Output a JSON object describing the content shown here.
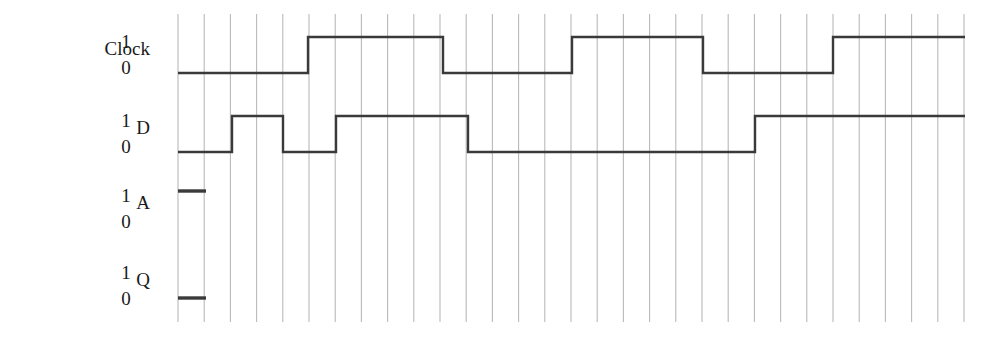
{
  "figure": {
    "type": "digital-timing-diagram",
    "background_color": "#ffffff",
    "grid_color": "#b9b9b9",
    "waveform_color": "#3a3a3a",
    "text_color": "#1a1a1a"
  },
  "signals": [
    {
      "name": "Clock",
      "label": "Clock",
      "high_level_label": "1",
      "low_level_label": "0",
      "high_y": 37,
      "low_y": 73,
      "label_x_right": 150,
      "label_y": 48,
      "level_label_x": 118,
      "high_label_y": 34,
      "low_label_y": 60,
      "segments": [
        {
          "level": 0,
          "start_x": 178,
          "end_x": 308
        },
        {
          "level": 1,
          "start_x": 308,
          "end_x": 443
        },
        {
          "level": 0,
          "start_x": 443,
          "end_x": 572
        },
        {
          "level": 1,
          "start_x": 572,
          "end_x": 703
        },
        {
          "level": 0,
          "start_x": 703,
          "end_x": 833
        },
        {
          "level": 1,
          "start_x": 833,
          "end_x": 965
        }
      ]
    },
    {
      "name": "D",
      "label": "D",
      "high_level_label": "1",
      "low_level_label": "0",
      "high_y": 116,
      "low_y": 152,
      "label_x_right": 150,
      "label_y": 127,
      "level_label_x": 118,
      "high_label_y": 113,
      "low_label_y": 139,
      "segments": [
        {
          "level": 0,
          "start_x": 178,
          "end_x": 232
        },
        {
          "level": 1,
          "start_x": 232,
          "end_x": 283
        },
        {
          "level": 0,
          "start_x": 283,
          "end_x": 336
        },
        {
          "level": 1,
          "start_x": 336,
          "end_x": 468
        },
        {
          "level": 0,
          "start_x": 468,
          "end_x": 755
        },
        {
          "level": 1,
          "start_x": 755,
          "end_x": 965
        }
      ]
    },
    {
      "name": "A",
      "label": "A",
      "high_level_label": "1",
      "low_level_label": "0",
      "high_y": 191,
      "low_y": 227,
      "label_x_right": 150,
      "label_y": 202,
      "level_label_x": 118,
      "high_label_y": 188,
      "low_label_y": 214,
      "segments": [
        {
          "level": 1,
          "start_x": 178,
          "end_x": 206
        }
      ]
    },
    {
      "name": "Q",
      "label": "Q",
      "high_level_label": "1",
      "low_level_label": "0",
      "high_y": 262,
      "low_y": 298,
      "label_x_right": 150,
      "label_y": 279,
      "level_label_x": 118,
      "high_label_y": 265,
      "low_label_y": 291,
      "segments": [
        {
          "level": 0,
          "start_x": 178,
          "end_x": 206
        }
      ]
    }
  ],
  "grid": {
    "first_x": 178,
    "spacing": 26.2,
    "count": 31,
    "top_y": 14,
    "bottom_y": 322
  }
}
